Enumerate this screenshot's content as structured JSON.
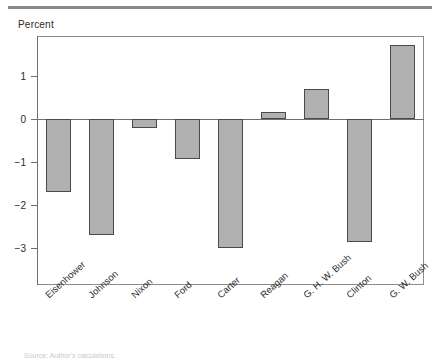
{
  "chart_data": {
    "type": "bar",
    "title": "",
    "ylabel": "Percent",
    "xlabel": "",
    "categories": [
      "Eisenhower",
      "Johnson",
      "Nixon",
      "Ford",
      "Carter",
      "Reagan",
      "G. H. W. Bush",
      "Clinton",
      "G. W. Bush"
    ],
    "values": [
      -1.7,
      -2.7,
      -0.2,
      -0.93,
      -3.0,
      0.17,
      0.7,
      -2.85,
      1.72
    ],
    "ylim": [
      -3.6,
      2.1
    ],
    "yticks": [
      1,
      0,
      -1,
      -2,
      -3
    ],
    "ytick_labels": [
      "1",
      "0",
      "−1",
      "−2",
      "−3"
    ],
    "grid": false,
    "legend": null,
    "bar_color": "#b0b0b0",
    "bar_edge_color": "#4a4a4a",
    "axis_color": "#6f6f6f"
  },
  "figure": {
    "top_rule_color": "#8a8a8a",
    "source_note": "Source: Author’s calculations."
  }
}
